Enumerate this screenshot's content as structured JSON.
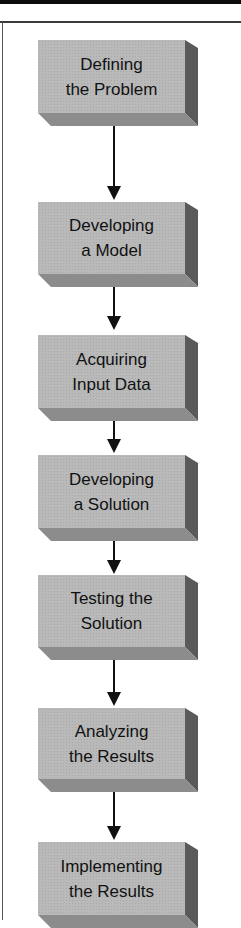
{
  "diagram": {
    "type": "flowchart",
    "direction": "top-to-bottom",
    "steps": [
      {
        "line1": "Defining",
        "line2": "the Problem"
      },
      {
        "line1": "Developing",
        "line2": "a Model"
      },
      {
        "line1": "Acquiring",
        "line2": "Input Data"
      },
      {
        "line1": "Developing",
        "line2": "a Solution"
      },
      {
        "line1": "Testing the",
        "line2": "Solution"
      },
      {
        "line1": "Analyzing",
        "line2": "the Results"
      },
      {
        "line1": "Implementing",
        "line2": "the Results"
      }
    ],
    "colors": {
      "box_face": "#b9b9b9",
      "box_side": "#5a5a5a",
      "box_bottom": "#8c8c8c",
      "arrow": "#111111",
      "text": "#111111"
    }
  }
}
